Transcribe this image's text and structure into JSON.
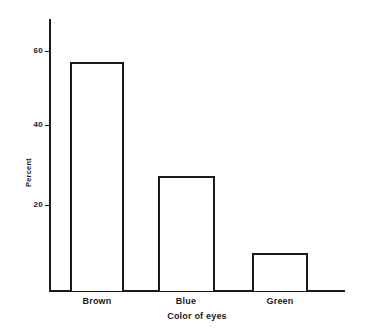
{
  "chart_data": {
    "type": "bar",
    "title": "",
    "subtitle": "",
    "categories": [
      "Brown",
      "Blue",
      "Green"
    ],
    "values": [
      60,
      30,
      10
    ],
    "xlabel": "Color of eyes",
    "ylabel": "Percent",
    "ylim": [
      0,
      70
    ],
    "yticks": [
      20,
      40,
      60
    ],
    "ytick_labels": [
      "20",
      "40",
      "60"
    ],
    "grid": false,
    "legend": null,
    "bar_style": {
      "fill": "#ffffff",
      "stroke": "#1a1a1a"
    },
    "annotations": []
  },
  "axes": {
    "y_title": "Percent",
    "x_title": "Color of eyes",
    "y_tick_labels": [
      "60",
      "40",
      "20"
    ],
    "x_tick_labels": [
      "Brown",
      "Blue",
      "Green"
    ]
  },
  "bars": [
    {
      "category": "Brown",
      "value": 60,
      "label": "Brown"
    },
    {
      "category": "Blue",
      "value": 30,
      "label": "Blue"
    },
    {
      "category": "Green",
      "value": 10,
      "label": "Green"
    }
  ],
  "colors": {
    "background": "#ffffff",
    "ink": "#1a1a1a",
    "bar_fill": "#ffffff",
    "bar_stroke": "#1a1a1a"
  }
}
